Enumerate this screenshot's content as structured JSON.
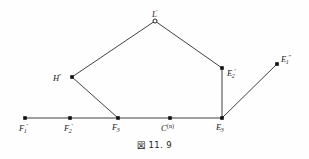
{
  "figure": {
    "caption_glyph": "図",
    "caption_number": "11. 9",
    "caption_full": "図 11. 9",
    "stroke_color": "#2b2b2b",
    "marker_color": "#111111",
    "background_color": "#fefefe",
    "width": 309,
    "height": 159
  },
  "chart_data": {
    "type": "diagram",
    "axis_ranges": {
      "x": [
        0,
        309
      ],
      "y": [
        0,
        159
      ]
    },
    "grid": false,
    "legend": "none",
    "points": [
      {
        "id": "F1p",
        "label": "F₁'",
        "x": 25,
        "y": 118,
        "marker": "filled-square",
        "label_dx": -6,
        "label_dy": 5
      },
      {
        "id": "F2p",
        "label": "F₂'",
        "x": 70,
        "y": 118,
        "marker": "filled-square",
        "label_dx": -6,
        "label_dy": 5
      },
      {
        "id": "F3",
        "label": "F₃",
        "x": 118,
        "y": 118,
        "marker": "filled-square",
        "label_dx": -6,
        "label_dy": 5
      },
      {
        "id": "Cn",
        "label": "C^(n)",
        "x": 170,
        "y": 118,
        "marker": "filled-square",
        "label_dx": -9,
        "label_dy": 5
      },
      {
        "id": "E3",
        "label": "E₃",
        "x": 222,
        "y": 118,
        "marker": "filled-square",
        "label_dx": -6,
        "label_dy": 5
      },
      {
        "id": "Hpp",
        "label": "H″",
        "x": 72,
        "y": 77,
        "marker": "filled-square",
        "label_dx": -19,
        "label_dy": -4
      },
      {
        "id": "Lp",
        "label": "L'",
        "x": 155,
        "y": 21,
        "marker": "open-circle",
        "label_dx": -3,
        "label_dy": -12
      },
      {
        "id": "E2p",
        "label": "E₂'",
        "x": 222,
        "y": 68,
        "marker": "filled-square",
        "label_dx": 5,
        "label_dy": 0
      },
      {
        "id": "E1pp",
        "label": "E₁″",
        "x": 277,
        "y": 64,
        "marker": "filled-square",
        "label_dx": 4,
        "label_dy": -10
      }
    ],
    "edges": [
      {
        "from": "F1p",
        "to": "E3",
        "name": "baseline-segment"
      },
      {
        "from": "F3",
        "to": "Hpp",
        "name": "F3-to-Hpp-segment"
      },
      {
        "from": "Hpp",
        "to": "Lp",
        "name": "Hpp-to-Lp-segment"
      },
      {
        "from": "Lp",
        "to": "E2p",
        "name": "Lp-to-E2p-segment"
      },
      {
        "from": "E2p",
        "to": "E3",
        "name": "E2p-to-E3-segment"
      },
      {
        "from": "E3",
        "to": "E1pp",
        "name": "E3-to-E1pp-segment"
      }
    ],
    "labels": {
      "F1p": {
        "base": "F",
        "sub": "1",
        "sup": "′"
      },
      "F2p": {
        "base": "F",
        "sub": "2",
        "sup": "′"
      },
      "F3": {
        "base": "F",
        "sub": "3",
        "sup": ""
      },
      "Cn": {
        "base": "C",
        "sub": "",
        "sup": "(n)"
      },
      "E3": {
        "base": "E",
        "sub": "3",
        "sup": ""
      },
      "Hpp": {
        "base": "H",
        "sub": "",
        "sup": "″"
      },
      "Lp": {
        "base": "L",
        "sub": "",
        "sup": "′"
      },
      "E2p": {
        "base": "E",
        "sub": "2",
        "sup": "′"
      },
      "E1pp": {
        "base": "E",
        "sub": "1",
        "sup": "″"
      }
    }
  }
}
